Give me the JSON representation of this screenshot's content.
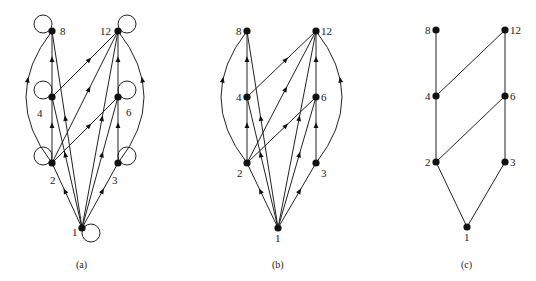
{
  "figure": {
    "panels": [
      {
        "id": "a",
        "caption": "(a)",
        "nodes": [
          {
            "id": "8",
            "label": "8",
            "x": 52,
            "y": 31,
            "lx": 60,
            "ly": 35
          },
          {
            "id": "12",
            "label": "12",
            "x": 118,
            "y": 31,
            "lx": 100,
            "ly": 35
          },
          {
            "id": "4",
            "label": "4",
            "x": 52,
            "y": 97,
            "lx": 37,
            "ly": 117
          },
          {
            "id": "6",
            "label": "6",
            "x": 118,
            "y": 97,
            "lx": 126,
            "ly": 116
          },
          {
            "id": "2",
            "label": "2",
            "x": 52,
            "y": 163,
            "lx": 50,
            "ly": 184
          },
          {
            "id": "3",
            "label": "3",
            "x": 118,
            "y": 163,
            "lx": 112,
            "ly": 184
          },
          {
            "id": "1",
            "label": "1",
            "x": 82,
            "y": 228,
            "lx": 72,
            "ly": 236
          }
        ],
        "loops": true,
        "edges": [
          [
            "1",
            "2"
          ],
          [
            "1",
            "3"
          ],
          [
            "1",
            "4"
          ],
          [
            "1",
            "6"
          ],
          [
            "1",
            "8"
          ],
          [
            "1",
            "12"
          ],
          [
            "2",
            "4"
          ],
          [
            "2",
            "6"
          ],
          [
            "2",
            "8"
          ],
          [
            "2",
            "12"
          ],
          [
            "3",
            "6"
          ],
          [
            "3",
            "12"
          ],
          [
            "4",
            "8"
          ],
          [
            "4",
            "12"
          ],
          [
            "6",
            "12"
          ]
        ]
      },
      {
        "id": "b",
        "caption": "(b)",
        "nodes": [
          {
            "id": "8",
            "label": "8",
            "x": 247,
            "y": 31,
            "lx": 236,
            "ly": 35
          },
          {
            "id": "12",
            "label": "12",
            "x": 316,
            "y": 31,
            "lx": 321,
            "ly": 35
          },
          {
            "id": "4",
            "label": "4",
            "x": 247,
            "y": 97,
            "lx": 236,
            "ly": 101
          },
          {
            "id": "6",
            "label": "6",
            "x": 316,
            "y": 97,
            "lx": 321,
            "ly": 101
          },
          {
            "id": "2",
            "label": "2",
            "x": 247,
            "y": 163,
            "lx": 237,
            "ly": 177
          },
          {
            "id": "3",
            "label": "3",
            "x": 316,
            "y": 163,
            "lx": 321,
            "ly": 177
          },
          {
            "id": "1",
            "label": "1",
            "x": 278,
            "y": 228,
            "lx": 275,
            "ly": 242
          }
        ],
        "loops": false,
        "edges": [
          [
            "1",
            "2"
          ],
          [
            "1",
            "3"
          ],
          [
            "1",
            "4"
          ],
          [
            "1",
            "6"
          ],
          [
            "1",
            "8"
          ],
          [
            "1",
            "12"
          ],
          [
            "2",
            "4"
          ],
          [
            "2",
            "6"
          ],
          [
            "2",
            "8"
          ],
          [
            "2",
            "12"
          ],
          [
            "3",
            "6"
          ],
          [
            "3",
            "12"
          ],
          [
            "4",
            "8"
          ],
          [
            "4",
            "12"
          ],
          [
            "6",
            "12"
          ]
        ]
      },
      {
        "id": "c",
        "caption": "(c)",
        "nodes": [
          {
            "id": "8",
            "label": "8",
            "x": 436,
            "y": 30,
            "lx": 425,
            "ly": 34
          },
          {
            "id": "12",
            "label": "12",
            "x": 505,
            "y": 30,
            "lx": 510,
            "ly": 34
          },
          {
            "id": "4",
            "label": "4",
            "x": 436,
            "y": 96,
            "lx": 425,
            "ly": 100
          },
          {
            "id": "6",
            "label": "6",
            "x": 505,
            "y": 96,
            "lx": 510,
            "ly": 100
          },
          {
            "id": "2",
            "label": "2",
            "x": 436,
            "y": 162,
            "lx": 425,
            "ly": 166
          },
          {
            "id": "3",
            "label": "3",
            "x": 505,
            "y": 162,
            "lx": 510,
            "ly": 166
          },
          {
            "id": "1",
            "label": "1",
            "x": 467,
            "y": 227,
            "lx": 464,
            "ly": 241
          }
        ],
        "loops": false,
        "hasse": true,
        "edges": [
          [
            "1",
            "2"
          ],
          [
            "1",
            "3"
          ],
          [
            "2",
            "4"
          ],
          [
            "2",
            "6"
          ],
          [
            "3",
            "6"
          ],
          [
            "4",
            "8"
          ],
          [
            "4",
            "12"
          ],
          [
            "6",
            "12"
          ]
        ]
      }
    ]
  }
}
